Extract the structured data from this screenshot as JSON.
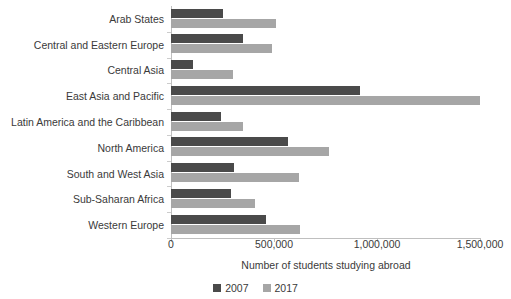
{
  "chart_data": {
    "type": "bar",
    "orientation": "horizontal",
    "title": "",
    "xlabel": "Number of students studying abroad",
    "ylabel": "",
    "xlim": [
      0,
      1550000
    ],
    "xticks": [
      0,
      500000,
      1000000,
      1500000
    ],
    "xticklabels": [
      "0",
      "500,000",
      "1,000,000",
      "1,500,000"
    ],
    "grid": false,
    "legend_position": "bottom",
    "categories": [
      "Arab States",
      "Central and Eastern Europe",
      "Central Asia",
      "East Asia and Pacific",
      "Latin America and the Caribbean",
      "North America",
      "South and West Asia",
      "Sub-Saharan Africa",
      "Western Europe"
    ],
    "series": [
      {
        "name": "2007",
        "color": "#4a4a4a",
        "values": [
          253000,
          350000,
          107000,
          918000,
          243000,
          568000,
          306000,
          291000,
          461000
        ]
      },
      {
        "name": "2017",
        "color": "#a6a6a6",
        "values": [
          510000,
          490000,
          300000,
          1500000,
          350000,
          767000,
          621000,
          408000,
          626000
        ]
      }
    ]
  },
  "axis": {
    "x_title": "Number of students studying abroad"
  },
  "legend": {
    "items": [
      {
        "label": "2007",
        "color": "#4a4a4a"
      },
      {
        "label": "2017",
        "color": "#a6a6a6"
      }
    ]
  }
}
